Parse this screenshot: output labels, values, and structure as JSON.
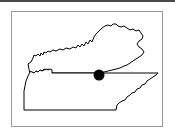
{
  "figure": {
    "kind": "locator-map",
    "caption": "",
    "background_color": "#ffffff",
    "line_color": "#000000",
    "frame_color": "#9a9a9a",
    "rule_color": "#4a4a4a"
  },
  "top_rule": {
    "label": "horizontal-divider"
  },
  "frame": {
    "label": "map-border",
    "x": 11,
    "y": 11,
    "width": 152,
    "height": 116
  },
  "map": {
    "title": "",
    "regions": [
      {
        "name": "Kentucky",
        "role": "northern-state-outline",
        "path": "M 29 69 L 28 64 L 31 62 L 33 58 L 34 55 L 36 56 L 38 54 L 40 56 L 41 53 L 43 55 L 44 52 L 46 53 L 48 51 L 50 52 L 53 50 L 56 51 L 60 49 L 63 50 L 66 48 L 70 49 L 73 47 L 76 48 L 78 45 L 80 47 L 82 44 L 84 46 L 86 42 L 88 44 L 90 40 L 92 42 L 94 37 L 96 34 L 99 31 L 102 28 L 105 26 L 108 25 L 111 26 L 113 24 L 116 24 L 118 26 L 121 27 L 124 26 L 127 28 L 130 30 L 133 29 L 136 31 L 139 30 L 141 33 L 143 36 L 142 39 L 139 41 L 137 44 L 139 47 L 142 49 L 144 52 L 142 55 L 139 57 L 136 59 L 133 61 L 130 63 L 127 65 L 124 66 L 120 68 L 116 69 L 112 70 L 108 71 L 104 72 L 100 73 L 96 73 L 92 73 L 88 73 L 84 73 L 80 73 L 76 73 L 72 73 L 68 73 L 64 73 L 60 73 L 56 73 L 52 73 L 50 70 L 48 69 L 46 70 L 44 69 L 42 71 L 40 70 L 38 72 L 36 71 L 34 73 L 32 72 L 30 72 Z"
      },
      {
        "name": "Tennessee",
        "role": "southern-state-outline",
        "path": "M 30 72 L 28 76 L 26 81 L 25 86 L 24 91 L 24 97 L 24 103 L 24 110 L 30 110 L 40 110 L 50 110 L 60 110 L 70 110 L 80 110 L 90 110 L 100 110 L 110 110 L 116 110 L 117 105 L 119 103 L 122 101 L 125 100 L 127 97 L 130 95 L 132 93 L 135 92 L 137 89 L 140 88 L 142 85 L 145 84 L 147 81 L 150 79 L 153 77 L 156 75 L 158 73 L 154 73 L 148 73 L 140 73 L 132 73 L 124 73 L 116 73 L 108 73 L 100 73 L 92 73 L 84 73 L 76 73 L 68 73 L 60 73 L 54 73 L 52 73 L 52 70 L 50 69 L 48 70 L 46 69 L 44 70 L 42 71 L 40 70 L 38 72 L 36 71 L 34 73 L 32 72 Z"
      }
    ],
    "marker": {
      "name": "location-marker",
      "shape": "filled-circle",
      "color": "#000000",
      "cx": 99,
      "cy": 75,
      "r": 5.5,
      "label": ""
    }
  }
}
